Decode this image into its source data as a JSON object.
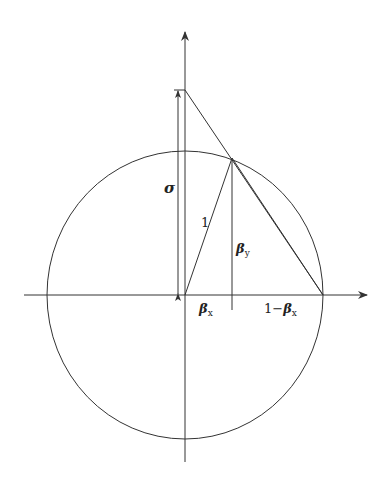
{
  "diagram": {
    "type": "geometric-construction",
    "elements": {
      "circle": {
        "label": "unit circle"
      },
      "axes": {
        "horizontal": "x-axis",
        "vertical": "y-axis"
      }
    },
    "labels": {
      "sigma": "σ",
      "radius": "1",
      "beta_y_main": "β",
      "beta_y_sub": "y",
      "beta_x_main": "β",
      "beta_x_sub": "x",
      "one_minus_prefix": "1−",
      "one_minus_main": "β",
      "one_minus_sub": "x"
    },
    "colors": {
      "stroke": "#333333",
      "background": "#ffffff"
    }
  }
}
